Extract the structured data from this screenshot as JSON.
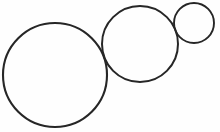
{
  "figure": {
    "kind": "line-drawing",
    "canvas": {
      "width": 220,
      "height": 132,
      "background_color": "#fefefe"
    },
    "style": {
      "stroke_color": "#262626",
      "stroke_width": 2,
      "fill_color": "none"
    },
    "shapes": [
      {
        "name": "large-circle",
        "order": 1,
        "size_label": "large",
        "cx": 55,
        "cy": 75,
        "r": 52,
        "stroke_color": "#262626",
        "stroke_width": 2.1,
        "fill_color": "none"
      },
      {
        "name": "medium-circle",
        "order": 2,
        "size_label": "medium",
        "cx": 140,
        "cy": 44,
        "r": 38,
        "stroke_color": "#262626",
        "stroke_width": 2.0,
        "fill_color": "none"
      },
      {
        "name": "small-circle",
        "order": 3,
        "size_label": "small",
        "cx": 194,
        "cy": 23,
        "r": 20,
        "stroke_color": "#262626",
        "stroke_width": 1.9,
        "fill_color": "none"
      }
    ]
  }
}
